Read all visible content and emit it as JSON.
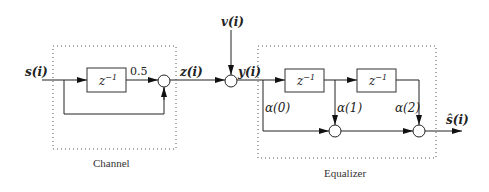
{
  "diagram": {
    "channel": {
      "label": "Channel",
      "input_label": "s(i)",
      "delay_label": "z",
      "delay_exp": "−1",
      "gain_label": "0.5",
      "output_label": "z(i)"
    },
    "noise": {
      "label": "v(i)"
    },
    "received": {
      "label": "y(i)"
    },
    "equalizer": {
      "label": "Equalizer",
      "delays": [
        {
          "base": "z",
          "exp": "−1"
        },
        {
          "base": "z",
          "exp": "−1"
        }
      ],
      "taps": [
        "α(0)",
        "α(1)",
        "α(2)"
      ],
      "output_label": "ŝ(i)"
    }
  }
}
